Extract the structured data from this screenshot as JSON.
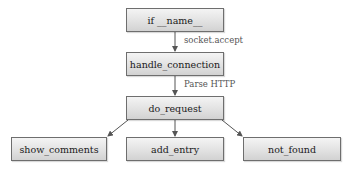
{
  "diagram": {
    "type": "flowchart",
    "colors": {
      "box_border": "#6e6e6e",
      "box_fill_top": "#f4f4f4",
      "box_fill_bottom": "#d2d2d2",
      "arrow": "#555555",
      "text": "#1a1a1a",
      "label_text": "#555555"
    },
    "nodes": {
      "main": {
        "label": "if __name__"
      },
      "handle_connection": {
        "label": "handle_connection"
      },
      "do_request": {
        "label": "do_request"
      },
      "show_comments": {
        "label": "show_comments"
      },
      "add_entry": {
        "label": "add_entry"
      },
      "not_found": {
        "label": "not_found"
      }
    },
    "edges": [
      {
        "from": "if __name__",
        "to": "handle_connection",
        "label": "socket.accept"
      },
      {
        "from": "handle_connection",
        "to": "do_request",
        "label": "Parse HTTP"
      },
      {
        "from": "do_request",
        "to": "show_comments",
        "label": ""
      },
      {
        "from": "do_request",
        "to": "add_entry",
        "label": ""
      },
      {
        "from": "do_request",
        "to": "not_found",
        "label": ""
      }
    ],
    "edge_labels": {
      "socket_accept": "socket.accept",
      "parse_http": "Parse HTTP"
    }
  }
}
